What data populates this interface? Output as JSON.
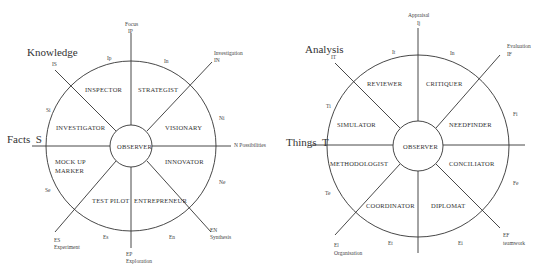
{
  "left": {
    "axis_labels": {
      "knowledge": "Knowledge",
      "facts": "Facts",
      "facts_letter": "S"
    },
    "poles": {
      "top": {
        "title": "Focus",
        "code": "IP"
      },
      "top_right": {
        "title": "Investigation",
        "code": "IN"
      },
      "top_left": {
        "code": "IS"
      },
      "right": {
        "title": "N Possibilities"
      },
      "bottom_right": {
        "code": "EN",
        "title": "Synthesis"
      },
      "bottom": {
        "code": "EP",
        "title": "Exploration"
      },
      "bottom_left": {
        "code": "ES",
        "title": "Experiment"
      }
    },
    "ring_codes": [
      "Ip",
      "In",
      "Ni",
      "Ne",
      "En",
      "Es",
      "Se",
      "Si"
    ],
    "center": "OBSERVER",
    "roles": [
      "INSPECTOR",
      "STRATEGIST",
      "VISIONARY",
      "INNOVATOR",
      "ENTREPRENEUR",
      "TEST PILOT",
      "MOCK UP",
      "MARKER",
      "INVESTIGATOR"
    ]
  },
  "right": {
    "axis_labels": {
      "analysis": "Analysis",
      "things": "Things",
      "things_letter": "T"
    },
    "poles": {
      "top": {
        "title": "Appraisal",
        "code": "Ij"
      },
      "top_right": {
        "title": "Evaluation",
        "code": "IF"
      },
      "top_left": {
        "code": "IT"
      },
      "bottom_right": {
        "code": "EF",
        "title": "teamwork"
      },
      "bottom_left": {
        "code": "El",
        "title": "Organisation"
      }
    },
    "ring_codes": [
      "It",
      "In",
      "Fi",
      "Fe",
      "Ei",
      "Et",
      "Te",
      "Ti"
    ],
    "center": "OBSERVER",
    "roles": [
      "REVIEWER",
      "CRITIQUER",
      "NEEDFINDER",
      "CONCILIATOR",
      "DIPLOMAT",
      "COORDINATOR",
      "METHODOLOGIST",
      "SIMULATOR"
    ]
  }
}
